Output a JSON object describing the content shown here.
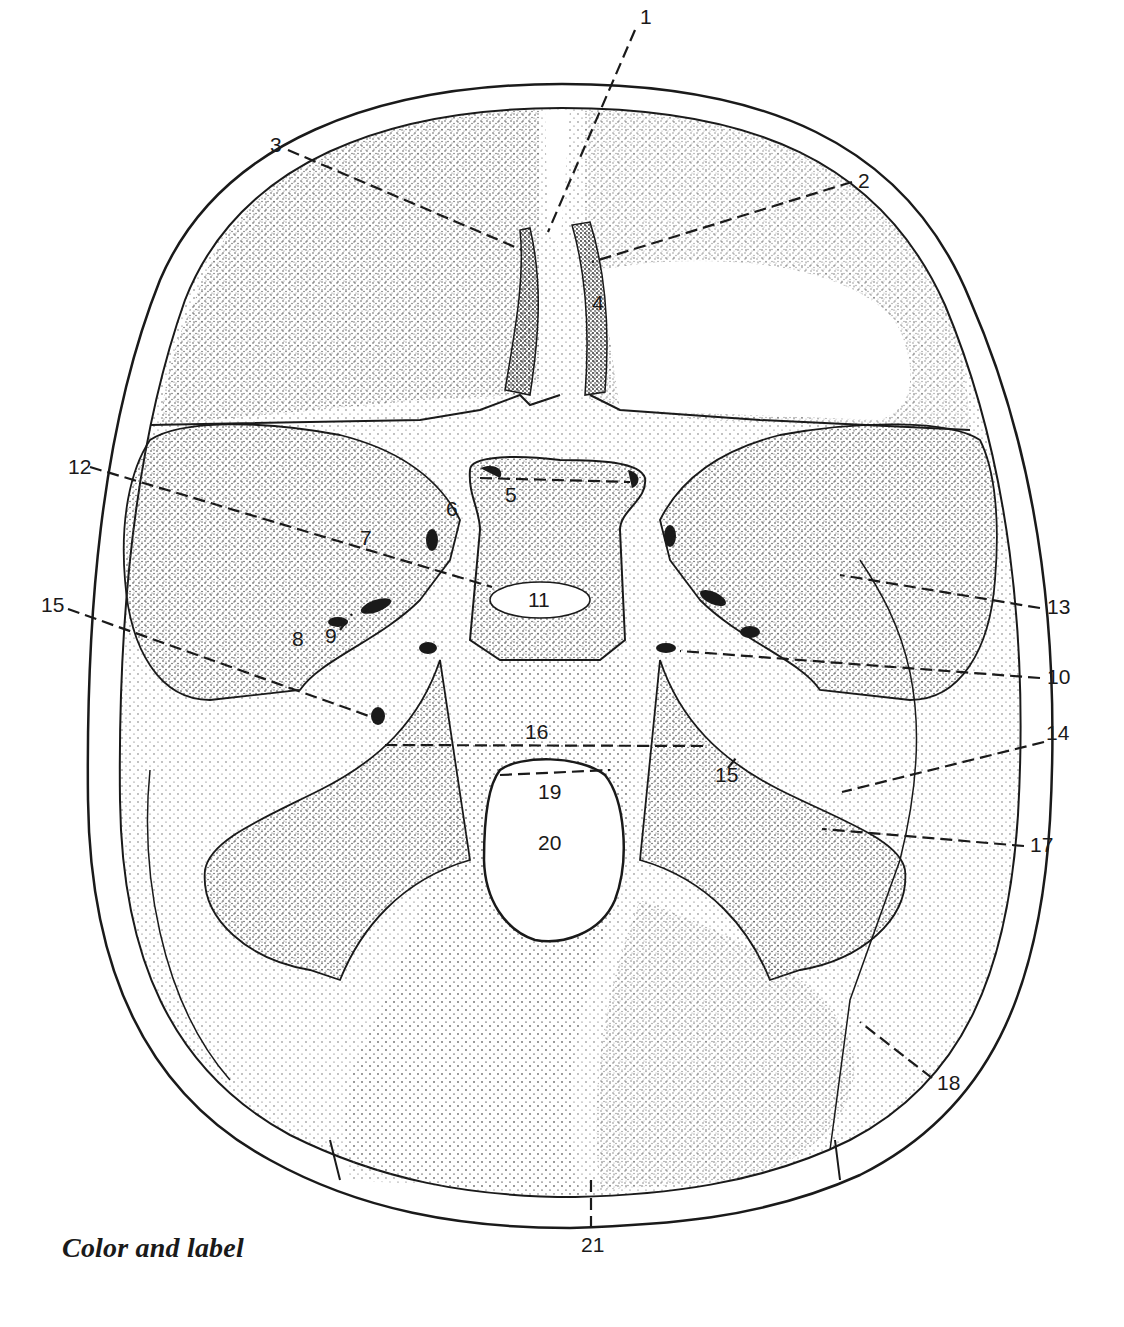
{
  "figure": {
    "caption": "Color and label",
    "colors": {
      "ink": "#1a1a1a",
      "paper": "#ffffff",
      "stipple": "#5a5a5a"
    }
  },
  "labels": [
    {
      "id": "1",
      "text": "1",
      "x": 640,
      "y": 24,
      "line": [
        [
          635,
          30
        ],
        [
          548,
          232
        ]
      ]
    },
    {
      "id": "2",
      "text": "2",
      "x": 858,
      "y": 188,
      "line": [
        [
          852,
          182
        ],
        [
          592,
          262
        ]
      ]
    },
    {
      "id": "3",
      "text": "3",
      "x": 270,
      "y": 152,
      "line": [
        [
          288,
          150
        ],
        [
          522,
          250
        ]
      ]
    },
    {
      "id": "4",
      "text": "4",
      "x": 592,
      "y": 310,
      "line": null
    },
    {
      "id": "5",
      "text": "5",
      "x": 505,
      "y": 502,
      "line": [
        [
          480,
          478
        ],
        [
          630,
          482
        ]
      ]
    },
    {
      "id": "6",
      "text": "6",
      "x": 446,
      "y": 516,
      "line": null
    },
    {
      "id": "7",
      "text": "7",
      "x": 360,
      "y": 545,
      "line": null
    },
    {
      "id": "8",
      "text": "8",
      "x": 292,
      "y": 646,
      "line": null
    },
    {
      "id": "9",
      "text": "9",
      "x": 325,
      "y": 643,
      "line": [
        [
          340,
          630
        ],
        [
          352,
          614
        ]
      ]
    },
    {
      "id": "10",
      "text": "10",
      "x": 1047,
      "y": 684,
      "line": [
        [
          1040,
          678
        ],
        [
          680,
          651
        ]
      ]
    },
    {
      "id": "11",
      "text": "11",
      "x": 528,
      "y": 607,
      "line": null
    },
    {
      "id": "12",
      "text": "12",
      "x": 68,
      "y": 474,
      "line": [
        [
          90,
          467
        ],
        [
          492,
          587
        ]
      ]
    },
    {
      "id": "13",
      "text": "13",
      "x": 1047,
      "y": 614,
      "line": [
        [
          1040,
          608
        ],
        [
          840,
          575
        ]
      ]
    },
    {
      "id": "14",
      "text": "14",
      "x": 1046,
      "y": 740,
      "line": [
        [
          1044,
          742
        ],
        [
          842,
          792
        ]
      ]
    },
    {
      "id": "15",
      "text": "15",
      "x": 41,
      "y": 612,
      "line": [
        [
          68,
          609
        ],
        [
          380,
          720
        ]
      ]
    },
    {
      "id": "15b",
      "text": "15",
      "x": 715,
      "y": 782,
      "line": [
        [
          728,
          768
        ],
        [
          736,
          758
        ]
      ]
    },
    {
      "id": "16",
      "text": "16",
      "x": 525,
      "y": 739,
      "line": [
        [
          385,
          745
        ],
        [
          705,
          746
        ]
      ]
    },
    {
      "id": "19",
      "text": "19",
      "x": 538,
      "y": 799,
      "line": [
        [
          500,
          775
        ],
        [
          610,
          770
        ]
      ]
    },
    {
      "id": "17",
      "text": "17",
      "x": 1030,
      "y": 852,
      "line": [
        [
          1024,
          846
        ],
        [
          822,
          829
        ]
      ]
    },
    {
      "id": "18",
      "text": "18",
      "x": 937,
      "y": 1090,
      "line": [
        [
          932,
          1078
        ],
        [
          860,
          1022
        ]
      ]
    },
    {
      "id": "20",
      "text": "20",
      "x": 538,
      "y": 850,
      "line": null
    },
    {
      "id": "21",
      "text": "21",
      "x": 581,
      "y": 1252,
      "line": [
        [
          591,
          1180
        ],
        [
          591,
          1232
        ]
      ]
    }
  ]
}
